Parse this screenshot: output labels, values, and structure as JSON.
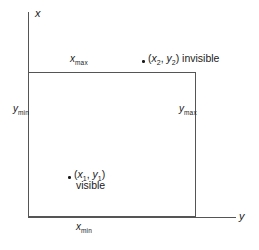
{
  "diagram": {
    "axes": {
      "vertical_axis_label": "x",
      "horizontal_axis_label": "y"
    },
    "window_bounds": {
      "top_label_var": "x",
      "top_label_sub": "max",
      "bottom_label_var": "x",
      "bottom_label_sub": "min",
      "left_label_var": "y",
      "left_label_sub": "min",
      "right_label_var": "y",
      "right_label_sub": "max"
    },
    "points": [
      {
        "id": "invisible-point",
        "open_paren": "(",
        "x_var": "x",
        "x_sub": "2",
        "separator": ", ",
        "y_var": "y",
        "y_sub": "2",
        "close_paren": ")",
        "status": "invisible"
      },
      {
        "id": "visible-point",
        "open_paren": "(",
        "x_var": "x",
        "x_sub": "1",
        "separator": ", ",
        "y_var": "y",
        "y_sub": "1",
        "close_paren": ")",
        "status": "visible"
      }
    ],
    "colors": {
      "line": "#555555",
      "text": "#1a1a1a",
      "background": "#ffffff"
    }
  }
}
